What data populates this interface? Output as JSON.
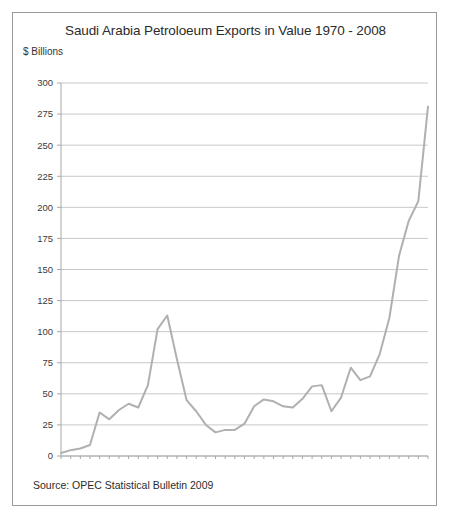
{
  "figure": {
    "title": "Saudi Arabia Petroloeum Exports in Value 1970 - 2008",
    "y_axis_caption": "$ Billions",
    "source": "Source: OPEC Statistical Bulletin 2009",
    "line_color": "#b0b0b0",
    "grid_color": "#c8c8c8",
    "axis_color": "#a8a8a8",
    "border_color": "#9a9a9a",
    "text_color": "#2b2b2b"
  },
  "chart_data": {
    "type": "line",
    "title": "Saudi Arabia Petroloeum Exports in Value 1970 - 2008",
    "xlabel": "",
    "ylabel": "$ Billions",
    "ylim": [
      0,
      300
    ],
    "yticks": [
      0,
      25,
      50,
      75,
      100,
      125,
      150,
      175,
      200,
      225,
      250,
      275,
      300
    ],
    "ytick_labels": [
      "0",
      "25",
      "50",
      "75",
      "100",
      "125",
      "150",
      "175",
      "200",
      "225",
      "250",
      "275",
      "300"
    ],
    "xlim": [
      1970,
      2008
    ],
    "xtick_labels": [
      "1970",
      "1972",
      "1974",
      "1976",
      "1978",
      "1980",
      "1982",
      "1984",
      "1986",
      "1988",
      "1990",
      "1992",
      "1994",
      "1996",
      "1998",
      "2000",
      "2002",
      "2004",
      "2006",
      "2008"
    ],
    "xticks_minor_every_year": true,
    "grid": "horizontal",
    "legend": "none",
    "x": [
      1970,
      1971,
      1972,
      1973,
      1974,
      1975,
      1976,
      1977,
      1978,
      1979,
      1980,
      1981,
      1982,
      1983,
      1984,
      1985,
      1986,
      1987,
      1988,
      1989,
      1990,
      1991,
      1992,
      1993,
      1994,
      1995,
      1996,
      1997,
      1998,
      1999,
      2000,
      2001,
      2002,
      2003,
      2004,
      2005,
      2006,
      2007,
      2008
    ],
    "values": [
      2.4,
      4.7,
      6.0,
      8.8,
      35.0,
      29.5,
      37.0,
      42.0,
      39.0,
      57.0,
      102.0,
      113.0,
      78.0,
      45.0,
      36.0,
      25.0,
      19.0,
      21.0,
      21.0,
      26.0,
      40.0,
      45.5,
      44.0,
      40.0,
      39.0,
      46.0,
      56.0,
      57.0,
      36.0,
      47.0,
      71.0,
      61.0,
      64.0,
      82.0,
      111.0,
      161.0,
      189.0,
      205.0,
      281.0
    ],
    "series": [
      {
        "name": "Petroleum exports value",
        "values": [
          2.4,
          4.7,
          6.0,
          8.8,
          35.0,
          29.5,
          37.0,
          42.0,
          39.0,
          57.0,
          102.0,
          113.0,
          78.0,
          45.0,
          36.0,
          25.0,
          19.0,
          21.0,
          21.0,
          26.0,
          40.0,
          45.5,
          44.0,
          40.0,
          39.0,
          46.0,
          56.0,
          57.0,
          36.0,
          47.0,
          71.0,
          61.0,
          64.0,
          82.0,
          111.0,
          161.0,
          189.0,
          205.0,
          281.0
        ]
      }
    ]
  }
}
